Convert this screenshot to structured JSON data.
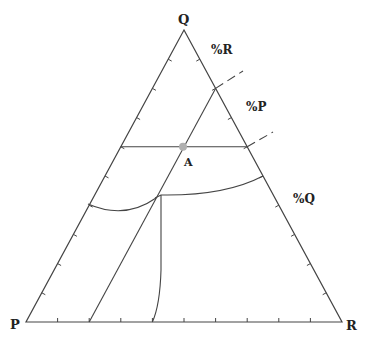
{
  "diagram": {
    "type": "ternary",
    "vertices": {
      "top": "Q",
      "bottom_left": "P",
      "bottom_right": "R"
    },
    "axis_labels": {
      "r_axis": "%R",
      "p_axis": "%P",
      "q_axis": "%Q"
    },
    "point": {
      "label": "A",
      "color": "#b0b0b0"
    },
    "ticks_per_side": 10,
    "line_color": "#444444",
    "background": "#ffffff"
  }
}
